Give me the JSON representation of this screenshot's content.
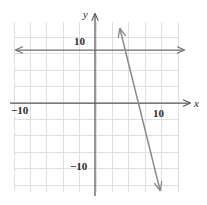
{
  "chart_data": {
    "type": "line",
    "title": "",
    "xlabel": "x",
    "ylabel": "y",
    "xlim": [
      -12.5,
      12.5
    ],
    "ylim": [
      -13,
      13
    ],
    "grid": true,
    "grid_step": 2.5,
    "legend": "none",
    "axis_labels": {
      "x_axis_name": "x",
      "y_axis_name": "y"
    },
    "tick_labels": {
      "x_negative": "−10",
      "x_positive": "10",
      "y_positive": "10",
      "y_negative": "−10"
    },
    "tick_values": {
      "x_negative": -10,
      "x_positive": 10,
      "y_positive": 10,
      "y_negative": -10
    },
    "series": [
      {
        "name": "steep-decreasing-line",
        "type": "line",
        "arrow_both_ends": true,
        "points": [
          {
            "x": -3.8,
            "y": 11.4
          },
          {
            "x": 2.5,
            "y": -13.7
          }
        ],
        "slope": -4,
        "x_intercept": 1.7,
        "y_intercept": 6.5,
        "color": "#8a8a8a"
      },
      {
        "name": "horizontal-line",
        "type": "line",
        "arrow_both_ends": true,
        "points": [
          {
            "x": -12.3,
            "y": 8.1
          },
          {
            "x": 13.5,
            "y": 8.1
          }
        ],
        "slope": 0,
        "y_intercept": 8.1,
        "color": "#6e6e6e"
      }
    ]
  },
  "colors": {
    "background": "#ffffff",
    "grid_line": "#dcdcdc",
    "axis_line": "#55555a",
    "curve": "#8a8a8a",
    "label_text": "#2b2b2b"
  },
  "geometry": {
    "grid_left": 14,
    "grid_right": 178,
    "grid_top": 22,
    "grid_bottom": 192,
    "origin_x": 95,
    "origin_y": 103,
    "cell_px": 16.4
  }
}
